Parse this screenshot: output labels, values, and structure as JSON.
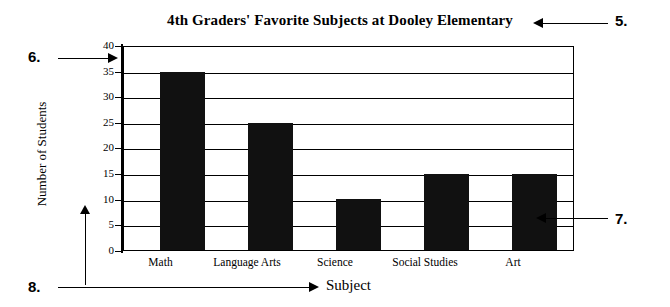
{
  "chart_data": {
    "type": "bar",
    "title": "4th Graders' Favorite Subjects at Dooley Elementary",
    "xlabel": "Subject",
    "ylabel": "Number of Students",
    "categories": [
      "Math",
      "Language Arts",
      "Science",
      "Social Studies",
      "Art"
    ],
    "values": [
      35,
      25,
      10,
      15,
      15
    ],
    "ylim": [
      0,
      40
    ],
    "ytick_step": 5,
    "yticks": [
      "40",
      "35",
      "30",
      "25",
      "20",
      "15",
      "10",
      "5",
      "0"
    ],
    "grid": true,
    "legend": "none",
    "bar_color": "#111111",
    "axis_color": "#000000",
    "background": "#ffffff"
  },
  "annotations": {
    "callout_title": "5.",
    "callout_yaxis": "6.",
    "callout_plot": "7.",
    "callout_xaxis": "8."
  }
}
